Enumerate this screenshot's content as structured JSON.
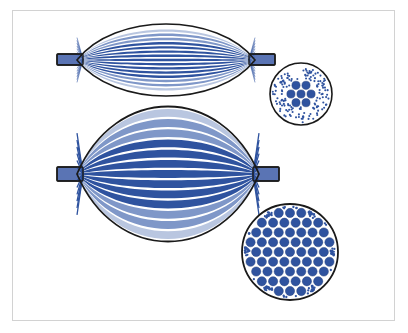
{
  "figure": {
    "title": "Skeletal muscle hypertrophy comparison diagram",
    "background_color": "#ffffff",
    "frame_color": "#d2d2d2"
  },
  "palette": {
    "fiber_blue": "#2f539f",
    "fiber_blue_light": "#7f97c8",
    "fiber_blue_pale": "#b9c6e0",
    "tendon_fill": "#5a74b4",
    "outline_black": "#1a1a1a",
    "dot_blue": "#2f539f",
    "white": "#ffffff"
  },
  "panels": [
    {
      "id": "normal-muscle",
      "label": "Normal muscle",
      "state": "untrained",
      "muscle": {
        "center_x": 166,
        "center_y": 60,
        "belly_half_length": 89,
        "belly_half_height": 24,
        "outline_color": "#1a1a1a",
        "outline_width": 1.6,
        "fiber_count": 17,
        "fiber_thickness": 1.6,
        "fiber_gap": 1.2,
        "fiber_style": "thin"
      },
      "tendons": [
        {
          "side": "left",
          "x": 57,
          "y": 54,
          "width": 26,
          "height": 11
        },
        {
          "side": "right",
          "x": 249,
          "y": 54,
          "width": 26,
          "height": 11
        }
      ],
      "cross_section": {
        "center_x": 301,
        "center_y": 94,
        "radius": 31,
        "outline_color": "#1a1a1a",
        "outline_width": 1.6,
        "large_fiber_count": 7,
        "large_fiber_radius": 4.1,
        "small_dot_count": 150,
        "small_dot_radius": 1.05,
        "packing": "hexagonal"
      }
    },
    {
      "id": "hypertrophied-muscle",
      "label": "Hypertrophied muscle",
      "state": "trained",
      "muscle": {
        "center_x": 168,
        "center_y": 174,
        "belly_half_length": 91,
        "belly_half_height": 45,
        "outline_color": "#1a1a1a",
        "outline_width": 1.8,
        "fiber_count": 13,
        "fiber_thickness": 5.2,
        "fiber_gap": 1.6,
        "fiber_style": "thick"
      },
      "tendons": [
        {
          "side": "left",
          "x": 57,
          "y": 167,
          "width": 26,
          "height": 14
        },
        {
          "side": "right",
          "x": 253,
          "y": 167,
          "width": 26,
          "height": 14
        }
      ],
      "cross_section": {
        "center_x": 290,
        "center_y": 252,
        "radius": 48,
        "outline_color": "#1a1a1a",
        "outline_width": 1.8,
        "large_fiber_count": 61,
        "large_fiber_radius": 4.6,
        "small_dot_count": 120,
        "small_dot_radius": 1.15,
        "packing": "hexagonal"
      }
    }
  ]
}
